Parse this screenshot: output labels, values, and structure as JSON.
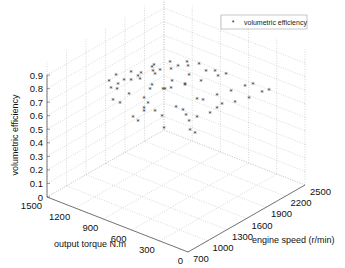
{
  "chart_data": {
    "type": "scatter3d",
    "title": "",
    "xlabel": "output torque N.m",
    "ylabel": "engine speed (r/min)",
    "zlabel": "volumetric efficiency",
    "x_ticks": [
      "0",
      "300",
      "600",
      "900",
      "1200",
      "1500"
    ],
    "y_ticks": [
      "700",
      "1000",
      "1300",
      "1600",
      "1900",
      "2200",
      "2500"
    ],
    "z_ticks": [
      "0",
      "0.1",
      "0.2",
      "0.3",
      "0.4",
      "0.5",
      "0.6",
      "0.7",
      "0.8",
      "0.9"
    ],
    "xlim": [
      0,
      1500
    ],
    "ylim": [
      700,
      2500
    ],
    "zlim": [
      0,
      1
    ],
    "grid": true,
    "legend": {
      "position": "top-right",
      "entries": [
        "volumetric efficiency"
      ]
    },
    "series": [
      {
        "name": "volumetric efficiency",
        "marker": "*",
        "color": "#333333",
        "points": [
          [
            1116,
            1099,
            0.85
          ],
          [
            1095,
            1175,
            0.88
          ],
          [
            1102,
            1109,
            0.8
          ],
          [
            1082,
            1173,
            0.78
          ],
          [
            1078,
            1274,
            0.82
          ],
          [
            1063,
            1361,
            0.8
          ],
          [
            1002,
            1272,
            0.9
          ],
          [
            1107,
            1147,
            0.7
          ],
          [
            1059,
            1186,
            0.68
          ],
          [
            1011,
            1254,
            0.74
          ],
          [
            988,
            1390,
            0.82
          ],
          [
            973,
            1384,
            0.87
          ],
          [
            941,
            1215,
            0.6
          ],
          [
            911,
            1248,
            0.57
          ],
          [
            879,
            1294,
            0.64
          ],
          [
            935,
            1528,
            0.9
          ],
          [
            903,
            1498,
            0.85
          ],
          [
            905,
            1455,
            0.78
          ],
          [
            871,
            1529,
            0.88
          ],
          [
            835,
            1631,
            0.92
          ],
          [
            827,
            1634,
            0.87
          ],
          [
            771,
            1661,
            0.9
          ],
          [
            728,
            1737,
            0.92
          ],
          [
            793,
            1600,
            0.8
          ],
          [
            904,
            1422,
            0.76
          ],
          [
            821,
            1503,
            0.76
          ],
          [
            824,
            1537,
            0.75
          ],
          [
            797,
            1591,
            0.75
          ],
          [
            882,
            1360,
            0.68
          ],
          [
            823,
            1383,
            0.63
          ],
          [
            769,
            1412,
            0.6
          ],
          [
            705,
            1535,
            0.65
          ],
          [
            672,
            1596,
            0.62
          ],
          [
            658,
            1621,
            0.58
          ],
          [
            618,
            1609,
            0.55
          ],
          [
            587,
            1580,
            0.5
          ],
          [
            630,
            1780,
            0.92
          ],
          [
            662,
            1673,
            0.86
          ],
          [
            569,
            1800,
            0.88
          ],
          [
            526,
            1877,
            0.87
          ],
          [
            497,
            1881,
            0.84
          ],
          [
            453,
            1940,
            0.85
          ],
          [
            609,
            1782,
            0.8
          ],
          [
            677,
            1634,
            0.8
          ],
          [
            276,
            1976,
            0.8
          ],
          [
            232,
            2035,
            0.81
          ],
          [
            161,
            2072,
            0.76
          ],
          [
            125,
            2127,
            0.77
          ],
          [
            369,
            1895,
            0.76
          ],
          [
            459,
            1809,
            0.73
          ],
          [
            237,
            1982,
            0.72
          ],
          [
            327,
            1896,
            0.69
          ],
          [
            555,
            1641,
            0.72
          ],
          [
            522,
            1685,
            0.71
          ],
          [
            402,
            1805,
            0.68
          ],
          [
            420,
            1753,
            0.66
          ],
          [
            468,
            1716,
            0.62
          ],
          [
            536,
            1614,
            0.6
          ],
          [
            552,
            1607,
            0.48
          ],
          [
            902,
            1327,
            0.72
          ],
          [
            882,
            1298,
            0.66
          ],
          [
            699,
            1341,
            0.55
          ],
          [
            708,
            1724,
            0.9
          ],
          [
            1101,
            1216,
            0.8
          ],
          [
            988,
            1360,
            0.85
          ],
          [
            925,
            1483,
            0.9
          ],
          [
            919,
            1490,
            0.87
          ],
          [
            696,
            1661,
            0.78
          ]
        ]
      }
    ]
  },
  "legend": {
    "marker": "*",
    "label": "volumetric efficiency"
  },
  "axes": {
    "x_label": "output torque N.m",
    "y_label": "engine speed (r/min)",
    "z_label": "volumetric efficiency"
  },
  "colors": {
    "grid": "#bdbdbd",
    "axis": "#555555",
    "marker": "#333333",
    "text": "#111111"
  }
}
